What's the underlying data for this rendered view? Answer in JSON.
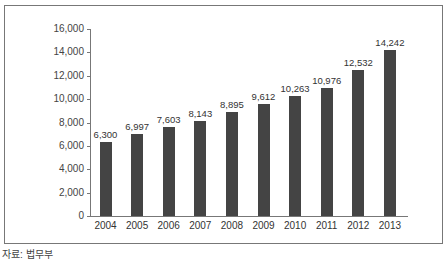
{
  "chart_data": {
    "type": "bar",
    "title": "",
    "xlabel": "",
    "ylabel": "",
    "categories": [
      "2004",
      "2005",
      "2006",
      "2007",
      "2008",
      "2009",
      "2010",
      "2011",
      "2012",
      "2013"
    ],
    "values": [
      6300,
      6997,
      7603,
      8143,
      8895,
      9612,
      10263,
      10976,
      12532,
      14242
    ],
    "value_labels": [
      "6,300",
      "6,997",
      "7,603",
      "8,143",
      "8,895",
      "9,612",
      "10,263",
      "10,976",
      "12,532",
      "14,242"
    ],
    "ylim": [
      0,
      16000
    ],
    "yticks": [
      "0",
      "2,000",
      "4,000",
      "6,000",
      "8,000",
      "10,000",
      "12,000",
      "14,000",
      "16,000"
    ],
    "grid": false,
    "legend": null,
    "bar_color": "#444444"
  },
  "source_note": "자료: 법무부"
}
